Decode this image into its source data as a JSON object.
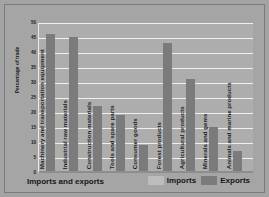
{
  "chart_data": {
    "type": "bar",
    "title": "",
    "xlabel": "Imports and exports",
    "ylabel": "Percentage of trade",
    "ylim": [
      0,
      50
    ],
    "yticks": [
      50,
      45,
      40,
      35,
      30,
      25,
      20,
      15,
      10,
      5,
      0
    ],
    "grid": true,
    "legend_position": "bottom-right",
    "categories": [
      "Machinery and transportation equipment",
      "Industrial raw materials",
      "Construction materials",
      "Tools and spare parts",
      "Consumer goods",
      "Forest products",
      "Agricultural products",
      "Minerals and gems",
      "Animals and marine products"
    ],
    "series": [
      {
        "name": "Imports",
        "values": [
          0,
          0,
          0,
          0,
          0,
          0,
          0,
          0,
          0
        ]
      },
      {
        "name": "Exports",
        "values": [
          46,
          45,
          22,
          19,
          9,
          43,
          31,
          15,
          7
        ]
      }
    ]
  },
  "legend": {
    "items": [
      {
        "label": "Imports",
        "color": "#bdbdbd"
      },
      {
        "label": "Exports",
        "color": "#7b7b7b"
      }
    ]
  },
  "colors": {
    "background": "#a5a5a5",
    "plot_background": "#adadad",
    "gridline": "#efefef",
    "imports_bar": "#bdbdbd",
    "exports_bar": "#7b7b7b",
    "text": "#161616"
  }
}
